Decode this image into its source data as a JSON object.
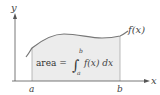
{
  "diagram": {
    "axes": {
      "x_label": "x",
      "y_label": "y"
    },
    "bounds": {
      "lower": "a",
      "upper": "b"
    },
    "curve_label": "f(x)",
    "formula": {
      "lhs": "area =",
      "integral_sign": "∫",
      "upper_limit": "b",
      "lower_limit": "a",
      "integrand": "f(x) dx"
    },
    "colors": {
      "axis": "#555555",
      "curve": "#777777",
      "shade": "#ececec",
      "bound_line": "#aaaaaa",
      "text": "#333333"
    }
  }
}
